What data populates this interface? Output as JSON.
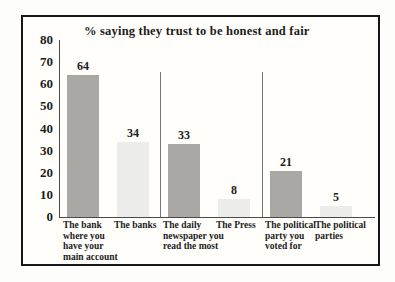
{
  "chart_data": {
    "type": "bar",
    "title": "% saying they trust to be honest and fair",
    "categories": [
      "The bank where you have your main account",
      "The banks",
      "The daily newspaper you read the most",
      "The Press",
      "The political party you voted for",
      "The political parties"
    ],
    "values": [
      64,
      34,
      33,
      8,
      21,
      5
    ],
    "bar_colors": [
      "#a9a8a4",
      "#ececea",
      "#a9a8a4",
      "#ececea",
      "#a9a8a4",
      "#ececea"
    ],
    "yticks": [
      0,
      10,
      20,
      30,
      40,
      50,
      60,
      70,
      80
    ],
    "ylim": [
      0,
      80
    ],
    "xlabel": "",
    "ylabel": "",
    "grid": false,
    "legend": false,
    "group_dividers_after_category": [
      2,
      4
    ],
    "colors": {
      "dark_bar": "#a9a8a4",
      "light_bar": "#ececea",
      "axis": "#4a4a4a",
      "divider": "#767672",
      "box_border": "#161616",
      "text": "#1c1c1c"
    }
  }
}
